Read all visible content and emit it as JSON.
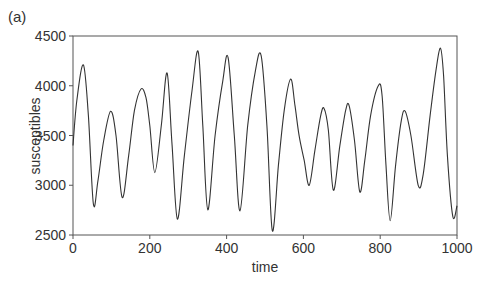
{
  "panel_label": "(a)",
  "chart_data": {
    "type": "line",
    "title": "",
    "panel_label": "(a)",
    "xlabel": "time",
    "ylabel": "susceptibles",
    "xlim": [
      0,
      1000
    ],
    "ylim": [
      2500,
      4500
    ],
    "xticks": [
      0,
      200,
      400,
      600,
      800,
      1000
    ],
    "yticks": [
      2500,
      3000,
      3500,
      4000,
      4500
    ],
    "grid": false,
    "legend": null,
    "series": [
      {
        "name": "susceptibles",
        "color": "#333333",
        "x": [
          0,
          10,
          27,
          40,
          53,
          65,
          80,
          98,
          112,
          128,
          145,
          160,
          177,
          190,
          200,
          213,
          230,
          245,
          258,
          272,
          290,
          310,
          326,
          338,
          351,
          370,
          390,
          404,
          420,
          435,
          455,
          475,
          490,
          505,
          519,
          535,
          550,
          567,
          578,
          589,
          602,
          615,
          630,
          645,
          654,
          665,
          678,
          695,
          710,
          719,
          733,
          747,
          760,
          775,
          795,
          805,
          815,
          826,
          840,
          855,
          865,
          880,
          899,
          912,
          930,
          945,
          957,
          965,
          975,
          989,
          1000
        ],
        "y": [
          3400,
          3850,
          4210,
          3700,
          2810,
          3050,
          3450,
          3743,
          3500,
          2877,
          3300,
          3750,
          3967,
          3880,
          3600,
          3127,
          3600,
          4127,
          3400,
          2660,
          3300,
          3950,
          4343,
          3600,
          2753,
          3500,
          4050,
          4283,
          3500,
          2743,
          3600,
          4150,
          4300,
          3600,
          2543,
          3200,
          3750,
          4067,
          3800,
          3493,
          3250,
          3000,
          3350,
          3700,
          3770,
          3550,
          2950,
          3400,
          3750,
          3800,
          3450,
          2933,
          3250,
          3700,
          4000,
          3900,
          3200,
          2643,
          3200,
          3650,
          3743,
          3500,
          3000,
          3110,
          3700,
          4150,
          4377,
          4100,
          3300,
          2687,
          2793
        ]
      }
    ]
  }
}
